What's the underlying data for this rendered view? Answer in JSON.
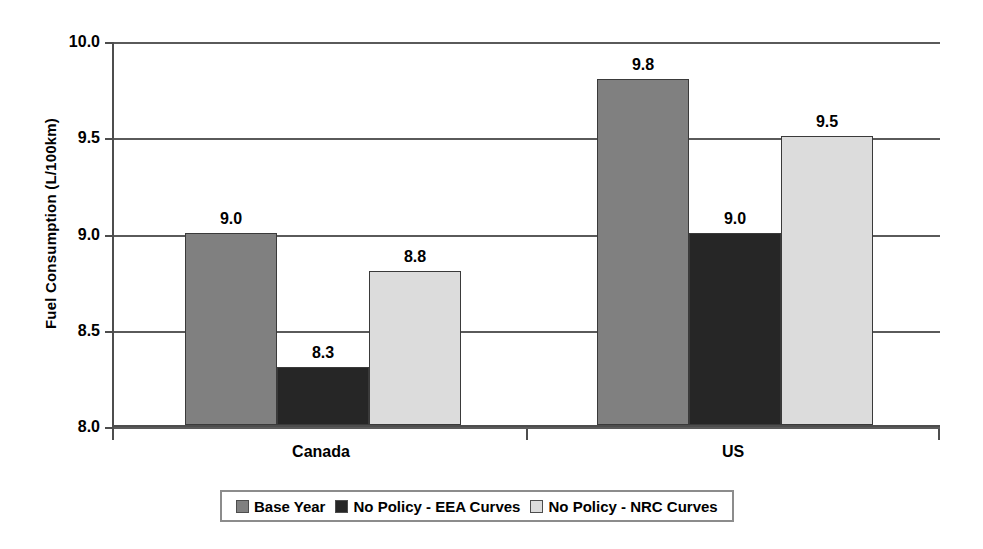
{
  "chart_data": {
    "type": "bar",
    "title": "",
    "xlabel": "",
    "ylabel": "Fuel Consumption (L/100km)",
    "categories": [
      "Canada",
      "US"
    ],
    "series": [
      {
        "name": "Base Year",
        "values": [
          9.0,
          9.8
        ],
        "color": "#808080",
        "labels": [
          "9.0",
          "9.8"
        ]
      },
      {
        "name": "No Policy - EEA Curves",
        "values": [
          8.3,
          9.0
        ],
        "color": "#262626",
        "labels": [
          "8.3",
          "9.0"
        ]
      },
      {
        "name": "No Policy - NRC Curves",
        "values": [
          8.8,
          9.5
        ],
        "color": "#dcdcdc",
        "labels": [
          "8.8",
          "9.5"
        ]
      }
    ],
    "ylim": [
      8.0,
      10.0
    ],
    "yticks": [
      "8.0",
      "8.5",
      "9.0",
      "9.5",
      "10.0"
    ],
    "ytick_values": [
      8.0,
      8.5,
      9.0,
      9.5,
      10.0
    ],
    "grid": true,
    "legend_position": "bottom"
  },
  "axis": {
    "y_title": "Fuel Consumption (L/100km)",
    "ticks": [
      {
        "label": "10.0",
        "value": 10.0
      },
      {
        "label": "9.5",
        "value": 9.5
      },
      {
        "label": "9.0",
        "value": 9.0
      },
      {
        "label": "8.5",
        "value": 8.5
      },
      {
        "label": "8.0",
        "value": 8.0
      }
    ]
  },
  "groups": [
    {
      "name": "Canada",
      "bars": [
        {
          "series": "Base Year",
          "value": 9.0,
          "label": "9.0"
        },
        {
          "series": "No Policy - EEA Curves",
          "value": 8.3,
          "label": "8.3"
        },
        {
          "series": "No Policy - NRC Curves",
          "value": 8.8,
          "label": "8.8"
        }
      ]
    },
    {
      "name": "US",
      "bars": [
        {
          "series": "Base Year",
          "value": 9.8,
          "label": "9.8"
        },
        {
          "series": "No Policy - EEA Curves",
          "value": 9.0,
          "label": "9.0"
        },
        {
          "series": "No Policy - NRC Curves",
          "value": 9.5,
          "label": "9.5"
        }
      ]
    }
  ],
  "legend": {
    "items": [
      {
        "label": "Base Year",
        "color": "#808080"
      },
      {
        "label": "No Policy - EEA Curves",
        "color": "#262626"
      },
      {
        "label": "No Policy - NRC Curves",
        "color": "#dcdcdc"
      }
    ]
  }
}
